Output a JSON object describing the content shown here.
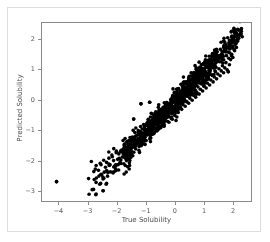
{
  "figure": {
    "background_color": "#ffffff",
    "outer_frame_color": "#dcdcdc",
    "axes_border_color": "#8a8a8a"
  },
  "chart_data": {
    "type": "scatter",
    "title": "",
    "xlabel": "True Solubility",
    "ylabel": "Predicted Solubility",
    "xlim": [
      -4.6,
      2.65
    ],
    "ylim": [
      -3.35,
      2.55
    ],
    "xticks": [
      -4,
      -3,
      -2,
      -1,
      0,
      1,
      2
    ],
    "xticklabels": [
      "−4",
      "−3",
      "−2",
      "−1",
      "0",
      "1",
      "2"
    ],
    "yticks": [
      -3,
      -2,
      -1,
      0,
      1,
      2
    ],
    "yticklabels": [
      "−3",
      "−2",
      "−1",
      "0",
      "1",
      "2"
    ],
    "grid": false,
    "legend": null,
    "marker": {
      "color": "#000000",
      "size_px": 3.6,
      "shape": "circle",
      "alpha": 1.0
    },
    "n_points": 1020,
    "relationship": "strong positive linear, predicted approximately equals true",
    "correlation_approx": 0.97,
    "residual_sigma_approx": 0.18,
    "density_note": "points concentrated between -1.5 and 1.5 along the diagonal, sparse tail toward lower-left",
    "outliers": [
      {
        "x": -4.1,
        "y": -2.65
      },
      {
        "x": -2.5,
        "y": -2.95
      },
      {
        "x": -1.2,
        "y": -0.1
      },
      {
        "x": 0.05,
        "y": -0.33
      },
      {
        "x": 1.8,
        "y": 0.95
      },
      {
        "x": -1.45,
        "y": -0.6
      },
      {
        "x": -0.9,
        "y": -0.05
      }
    ],
    "points": [
      [
        -4.1,
        -2.65
      ],
      [
        -2.5,
        -2.95
      ],
      [
        -3.0,
        -2.55
      ],
      [
        -2.82,
        -2.32
      ],
      [
        -2.74,
        -2.12
      ],
      [
        -2.66,
        -2.28
      ],
      [
        -2.6,
        -2.05
      ],
      [
        -2.55,
        -2.42
      ],
      [
        -2.48,
        -1.95
      ],
      [
        -2.42,
        -2.18
      ],
      [
        -2.38,
        -2.02
      ],
      [
        -2.3,
        -1.88
      ],
      [
        -2.26,
        -2.1
      ],
      [
        -2.2,
        -1.78
      ],
      [
        -2.14,
        -1.96
      ],
      [
        -2.1,
        -2.14
      ],
      [
        -2.05,
        -1.7
      ],
      [
        -2.0,
        -1.92
      ],
      [
        -1.96,
        -1.74
      ],
      [
        -1.92,
        -2.05
      ],
      [
        -1.88,
        -1.62
      ],
      [
        -1.84,
        -1.84
      ],
      [
        -1.8,
        -1.7
      ],
      [
        -1.76,
        -1.52
      ],
      [
        -1.72,
        -1.9
      ],
      [
        -1.68,
        -1.6
      ],
      [
        -1.64,
        -1.75
      ],
      [
        -1.6,
        -1.45
      ],
      [
        -1.56,
        -1.68
      ],
      [
        -1.52,
        -1.55
      ],
      [
        -1.48,
        -1.8
      ],
      [
        -1.45,
        -0.6
      ],
      [
        -1.42,
        -1.38
      ],
      [
        -1.38,
        -1.58
      ],
      [
        -1.34,
        -1.42
      ],
      [
        -1.3,
        -1.25
      ],
      [
        -1.26,
        -1.5
      ],
      [
        -1.22,
        -1.32
      ],
      [
        -1.2,
        -0.1
      ],
      [
        -1.18,
        -1.15
      ],
      [
        -1.14,
        -1.4
      ],
      [
        -1.1,
        -1.22
      ],
      [
        -1.06,
        -1.05
      ],
      [
        -1.02,
        -1.3
      ],
      [
        -0.98,
        -1.12
      ],
      [
        -0.94,
        -0.95
      ],
      [
        -0.9,
        -0.05
      ],
      [
        -0.88,
        -1.2
      ],
      [
        -0.84,
        -1.02
      ],
      [
        -0.8,
        -0.85
      ],
      [
        -0.76,
        -1.08
      ],
      [
        -0.72,
        -0.92
      ],
      [
        -0.68,
        -0.75
      ],
      [
        -0.64,
        -0.98
      ],
      [
        -0.6,
        -0.82
      ],
      [
        -0.56,
        -0.65
      ],
      [
        -0.52,
        -0.88
      ],
      [
        -0.48,
        -0.72
      ],
      [
        -0.44,
        -0.55
      ],
      [
        -0.4,
        -0.78
      ],
      [
        -0.36,
        -0.62
      ],
      [
        -0.32,
        -0.45
      ],
      [
        -0.28,
        -0.68
      ],
      [
        -0.24,
        -0.52
      ],
      [
        -0.2,
        -0.35
      ],
      [
        -0.16,
        -0.58
      ],
      [
        -0.12,
        -0.42
      ],
      [
        -0.08,
        -0.25
      ],
      [
        -0.04,
        -0.48
      ],
      [
        0.0,
        -0.32
      ],
      [
        0.05,
        -0.33
      ],
      [
        0.04,
        -0.15
      ],
      [
        0.08,
        -0.38
      ],
      [
        0.12,
        -0.22
      ],
      [
        0.16,
        -0.05
      ],
      [
        0.2,
        -0.28
      ],
      [
        0.24,
        -0.12
      ],
      [
        0.28,
        0.05
      ],
      [
        0.32,
        -0.18
      ],
      [
        0.36,
        -0.02
      ],
      [
        0.4,
        0.15
      ],
      [
        0.44,
        -0.08
      ],
      [
        0.48,
        0.08
      ],
      [
        0.52,
        0.25
      ],
      [
        0.56,
        0.02
      ],
      [
        0.6,
        0.18
      ],
      [
        0.64,
        0.35
      ],
      [
        0.68,
        0.12
      ],
      [
        0.72,
        0.28
      ],
      [
        0.76,
        0.45
      ],
      [
        0.8,
        0.22
      ],
      [
        0.84,
        0.38
      ],
      [
        0.88,
        0.55
      ],
      [
        0.92,
        0.32
      ],
      [
        0.96,
        0.48
      ],
      [
        1.0,
        0.65
      ],
      [
        1.04,
        0.42
      ],
      [
        1.08,
        0.58
      ],
      [
        1.12,
        0.75
      ],
      [
        1.16,
        0.52
      ],
      [
        1.2,
        0.68
      ],
      [
        1.24,
        0.85
      ],
      [
        1.28,
        0.62
      ],
      [
        1.32,
        0.78
      ],
      [
        1.36,
        0.95
      ],
      [
        1.4,
        0.72
      ],
      [
        1.44,
        0.88
      ],
      [
        1.48,
        1.05
      ],
      [
        1.52,
        0.82
      ],
      [
        1.56,
        0.98
      ],
      [
        1.6,
        1.15
      ],
      [
        1.64,
        0.92
      ],
      [
        1.68,
        1.08
      ],
      [
        1.72,
        1.25
      ],
      [
        1.76,
        1.02
      ],
      [
        1.8,
        0.95
      ],
      [
        1.84,
        1.18
      ],
      [
        1.88,
        1.35
      ],
      [
        1.92,
        1.52
      ],
      [
        1.96,
        1.42
      ],
      [
        2.0,
        1.68
      ],
      [
        2.04,
        1.85
      ],
      [
        2.08,
        1.75
      ],
      [
        2.12,
        1.95
      ],
      [
        2.16,
        2.05
      ],
      [
        2.2,
        2.15
      ],
      [
        2.24,
        2.2
      ],
      [
        2.28,
        2.1
      ]
    ]
  }
}
